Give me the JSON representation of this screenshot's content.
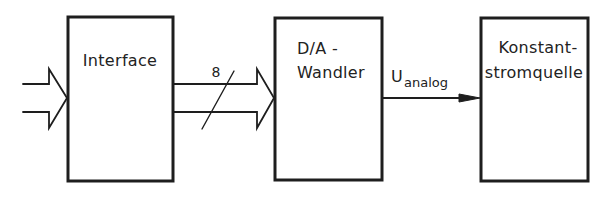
{
  "diagram": {
    "type": "block-diagram",
    "colors": {
      "stroke": "#1e1e1e",
      "text": "#222222",
      "background": "#ffffff"
    },
    "blocks": [
      {
        "id": "interface",
        "lines": [
          "Interface"
        ]
      },
      {
        "id": "da_converter",
        "lines": [
          "D/A -",
          "Wandler"
        ]
      },
      {
        "id": "current_source",
        "lines": [
          "Konstant-",
          "stromquelle"
        ]
      }
    ],
    "connections": [
      {
        "from": "external-input",
        "to": "interface",
        "style": "hollow-double-arrow",
        "label": ""
      },
      {
        "from": "interface",
        "to": "da_converter",
        "style": "hollow-double-arrow-bus",
        "label": "8"
      },
      {
        "from": "da_converter",
        "to": "current_source",
        "style": "filled-arrow",
        "label_main": "U",
        "label_sub": "analog"
      }
    ]
  }
}
